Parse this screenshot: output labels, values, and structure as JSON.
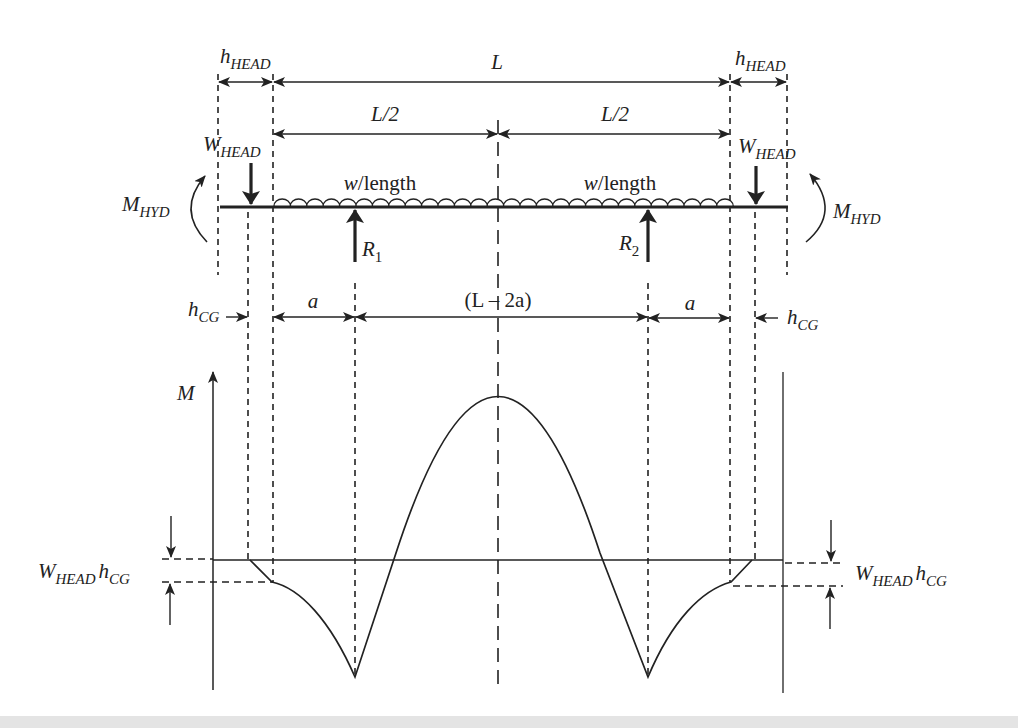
{
  "figure": {
    "type": "beam free-body and bending moment diagram",
    "colors": {
      "line": "#222222",
      "background": "#ffffff",
      "footer_strip": "#e4e4e4"
    }
  },
  "dimensions": {
    "h_head_left": {
      "main": "h",
      "sub": "HEAD"
    },
    "L": "L",
    "h_head_right": {
      "main": "h",
      "sub": "HEAD"
    },
    "half_left": "L/2",
    "half_right": "L/2",
    "h_cg_left": {
      "main": "h",
      "sub": "CG"
    },
    "a_left": "a",
    "middle_span": "(L – 2a)",
    "a_right": "a",
    "h_cg_right": {
      "main": "h",
      "sub": "CG"
    }
  },
  "loads": {
    "w_head_left": {
      "main": "W",
      "sub": "HEAD"
    },
    "w_head_right": {
      "main": "W",
      "sub": "HEAD"
    },
    "m_hyd_left": {
      "main": "M",
      "sub": "HYD"
    },
    "m_hyd_right": {
      "main": "M",
      "sub": "HYD"
    },
    "distributed_left": {
      "w": "w",
      "rest": "/length"
    },
    "distributed_right": {
      "w": "w",
      "rest": "/length"
    },
    "reaction_1": {
      "main": "R",
      "sub": "1"
    },
    "reaction_2": {
      "main": "R",
      "sub": "2"
    }
  },
  "moment_diagram": {
    "axis_label": "M",
    "step_left": {
      "w": "W",
      "wsub": "HEAD",
      "h": "h",
      "hsub": "CG"
    },
    "step_right": {
      "w": "W",
      "wsub": "HEAD",
      "h": "h",
      "hsub": "CG"
    }
  }
}
